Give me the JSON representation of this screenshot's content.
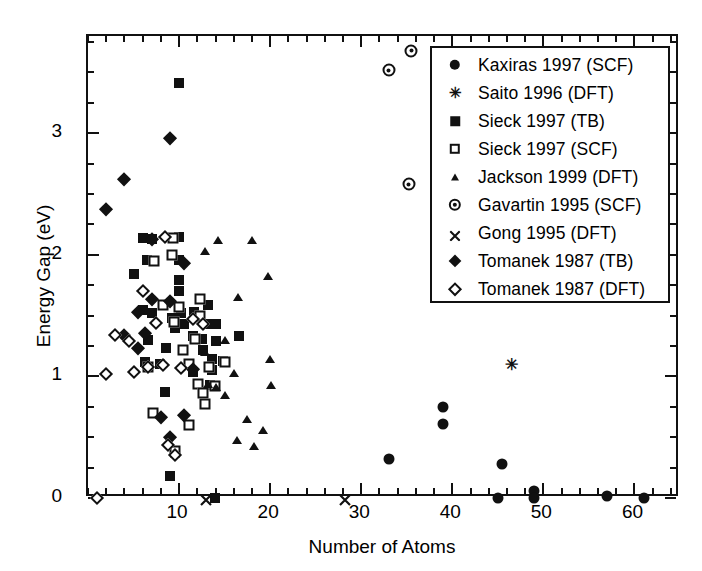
{
  "chart_data": {
    "type": "scatter",
    "title": "",
    "xlabel": "Number of Atoms",
    "ylabel": "Energy Gap (eV)",
    "xlim": [
      0,
      65
    ],
    "ylim": [
      0,
      3.8
    ],
    "xticks": [
      10,
      20,
      30,
      40,
      50,
      60
    ],
    "yticks": [
      0,
      1,
      2,
      3
    ],
    "xtick_labels": [
      "10",
      "20",
      "30",
      "40",
      "50",
      "60"
    ],
    "ytick_labels": [
      "0",
      "1",
      "2",
      "3"
    ],
    "x_minor_step": 2,
    "y_minor_step": 0.25,
    "grid": false,
    "legend_position": "top-right",
    "series": [
      {
        "name": "Kaxiras 1997 (SCF)",
        "marker": "circle",
        "points": [
          [
            33,
            0.32
          ],
          [
            39,
            0.75
          ],
          [
            39,
            0.61
          ],
          [
            45.5,
            0.28
          ],
          [
            45,
            0.0
          ],
          [
            49,
            0.06
          ],
          [
            49,
            0.0
          ],
          [
            57,
            0.02
          ],
          [
            61,
            0.0
          ]
        ]
      },
      {
        "name": "Saito 1996 (DFT)",
        "marker": "star",
        "points": [
          [
            46.5,
            1.09
          ]
        ]
      },
      {
        "name": "Sieck 1997 (TB)",
        "marker": "square",
        "points": [
          [
            10,
            3.41
          ],
          [
            5,
            1.84
          ],
          [
            6,
            2.14
          ],
          [
            7,
            2.13
          ],
          [
            6.5,
            1.96
          ],
          [
            6,
            1.55
          ],
          [
            7,
            1.52
          ],
          [
            10,
            2.15
          ],
          [
            10,
            1.96
          ],
          [
            10,
            1.79
          ],
          [
            10,
            1.7
          ],
          [
            10.2,
            1.52
          ],
          [
            6.6,
            1.3
          ],
          [
            9.2,
            1.48
          ],
          [
            11.5,
            1.33
          ],
          [
            11.6,
            1.53
          ],
          [
            13.2,
            1.59
          ],
          [
            13.1,
            1.43
          ],
          [
            14,
            1.43
          ],
          [
            12.6,
            1.22
          ],
          [
            13.6,
            1.14
          ],
          [
            13.6,
            1.05
          ],
          [
            13.4,
            0.93
          ],
          [
            10.5,
            1.43
          ],
          [
            8.4,
            0.87
          ],
          [
            7.9,
            1.1
          ],
          [
            11.5,
            1.04
          ],
          [
            14,
            1.29
          ],
          [
            9.6,
            1.4
          ],
          [
            8.6,
            1.23
          ],
          [
            12.5,
            1.31
          ],
          [
            9.0,
            0.18
          ],
          [
            6.3,
            1.12
          ],
          [
            13.9,
            0.0
          ],
          [
            9.6,
            0.37
          ],
          [
            14.8,
            1.13
          ],
          [
            16.6,
            1.33
          ]
        ]
      },
      {
        "name": "Sieck 1997 (SCF)",
        "marker": "open-square",
        "points": [
          [
            9.3,
            2.14
          ],
          [
            7.3,
            1.95
          ],
          [
            9.2,
            2.0
          ],
          [
            12.3,
            1.5
          ],
          [
            11.8,
            1.31
          ],
          [
            10.0,
            1.57
          ],
          [
            12.3,
            1.64
          ],
          [
            9.4,
            1.45
          ],
          [
            11.1,
            1.1
          ],
          [
            12.1,
            0.94
          ],
          [
            12.6,
            0.86
          ],
          [
            12.8,
            0.77
          ],
          [
            11.1,
            0.6
          ],
          [
            13.9,
            0.92
          ],
          [
            13.3,
            1.08
          ],
          [
            6.6,
            1.08
          ],
          [
            9.6,
            0.39
          ],
          [
            10.4,
            1.22
          ],
          [
            15.0,
            1.12
          ],
          [
            8.2,
            1.59
          ],
          [
            7.1,
            0.7
          ]
        ]
      },
      {
        "name": "Jackson 1999 (DFT)",
        "marker": "triangle",
        "points": [
          [
            14.3,
            2.12
          ],
          [
            18.0,
            2.12
          ],
          [
            12.8,
            2.03
          ],
          [
            19.8,
            1.83
          ],
          [
            16.5,
            1.65
          ],
          [
            15.0,
            1.3
          ],
          [
            20.0,
            1.14
          ],
          [
            20.1,
            0.93
          ],
          [
            12.8,
            1.2
          ],
          [
            14.0,
            0.91
          ],
          [
            16.0,
            1.03
          ],
          [
            13.2,
            0.94
          ],
          [
            17.5,
            0.65
          ],
          [
            19.2,
            0.56
          ],
          [
            16.4,
            0.48
          ],
          [
            18.2,
            0.43
          ],
          [
            15.0,
            0.85
          ]
        ]
      },
      {
        "name": "Gavartin 1995 (SCF)",
        "marker": "circle-dot",
        "points": [
          [
            33,
            3.52
          ],
          [
            35.5,
            3.68
          ],
          [
            35.2,
            2.58
          ]
        ]
      },
      {
        "name": "Gong 1995 (DFT)",
        "marker": "cross",
        "points": [
          [
            13.0,
            0.0
          ],
          [
            28.2,
            0.0
          ]
        ]
      },
      {
        "name": "Tomanek 1987 (TB)",
        "marker": "diamond",
        "points": [
          [
            2,
            2.38
          ],
          [
            4,
            2.62
          ],
          [
            9,
            2.96
          ],
          [
            7,
            2.13
          ],
          [
            5.5,
            1.53
          ],
          [
            10.5,
            1.93
          ],
          [
            7.0,
            1.64
          ],
          [
            4.0,
            1.34
          ],
          [
            5.5,
            1.23
          ],
          [
            8.0,
            0.67
          ],
          [
            9.0,
            0.5
          ],
          [
            10.5,
            0.68
          ],
          [
            6.3,
            1.36
          ],
          [
            9.0,
            1.62
          ],
          [
            11.5,
            1.06
          ]
        ]
      },
      {
        "name": "Tomanek 1987 (DFT)",
        "marker": "open-diamond",
        "points": [
          [
            1.0,
            0.0
          ],
          [
            2.0,
            1.02
          ],
          [
            5.0,
            1.04
          ],
          [
            6.6,
            1.08
          ],
          [
            4.5,
            1.29
          ],
          [
            6.0,
            1.7
          ],
          [
            8.5,
            2.15
          ],
          [
            11.5,
            1.47
          ],
          [
            10.2,
            1.07
          ],
          [
            8.2,
            1.09
          ],
          [
            8.8,
            0.44
          ],
          [
            9.5,
            0.35
          ],
          [
            7.5,
            1.44
          ],
          [
            12.6,
            1.43
          ],
          [
            3.0,
            1.34
          ]
        ]
      }
    ]
  },
  "legend": {
    "entries": [
      {
        "label": "Kaxiras 1997 (SCF)",
        "marker": "circle"
      },
      {
        "label": "Saito 1996 (DFT)",
        "marker": "star"
      },
      {
        "label": "Sieck 1997 (TB)",
        "marker": "square"
      },
      {
        "label": "Sieck 1997 (SCF)",
        "marker": "open-square"
      },
      {
        "label": "Jackson 1999 (DFT)",
        "marker": "triangle"
      },
      {
        "label": "Gavartin 1995 (SCF)",
        "marker": "circle-dot"
      },
      {
        "label": "Gong 1995 (DFT)",
        "marker": "cross"
      },
      {
        "label": "Tomanek 1987 (TB)",
        "marker": "diamond"
      },
      {
        "label": "Tomanek 1987 (DFT)",
        "marker": "open-diamond"
      }
    ]
  },
  "colors": {
    "ink": "#111111",
    "background": "#ffffff"
  }
}
